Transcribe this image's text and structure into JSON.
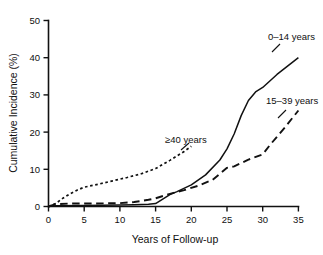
{
  "chart_data": {
    "type": "line",
    "title": "",
    "xlabel": "Years of Follow-up",
    "ylabel": "Cumulative Incidence (%)",
    "xlim": [
      0,
      35
    ],
    "ylim": [
      0,
      50
    ],
    "xticks": [
      "0",
      "5",
      "10",
      "15",
      "20",
      "25",
      "30",
      "35"
    ],
    "yticks": [
      "0",
      "10",
      "20",
      "30",
      "40",
      "50"
    ],
    "grid": false,
    "legend_position": "inline-annotations",
    "series": [
      {
        "name": "0–14 years",
        "style": "solid",
        "color": "#111111",
        "x": [
          0,
          1,
          5,
          10,
          12,
          14,
          15,
          16,
          17,
          18,
          20,
          22,
          24,
          25,
          26,
          27,
          28,
          29,
          30,
          32,
          35
        ],
        "values": [
          0,
          0.2,
          0.3,
          0.4,
          0.5,
          0.6,
          0.8,
          2.0,
          3.2,
          4.0,
          5.8,
          8.5,
          12.5,
          15.5,
          19.5,
          24.5,
          28.5,
          30.8,
          32.0,
          35.5,
          40.0
        ]
      },
      {
        "name": "15–39 years",
        "style": "dashed",
        "color": "#111111",
        "x": [
          0,
          1,
          3,
          6,
          10,
          12,
          14,
          15,
          17,
          19,
          21,
          23,
          25,
          26,
          28,
          30,
          31,
          33,
          35
        ],
        "values": [
          0,
          0.6,
          0.8,
          0.8,
          0.9,
          1.2,
          1.8,
          2.2,
          3.4,
          4.4,
          5.6,
          7.2,
          10.4,
          10.8,
          12.6,
          14.0,
          16.5,
          21.0,
          25.8
        ]
      },
      {
        "name": "≥40 years",
        "style": "dotted",
        "color": "#111111",
        "x": [
          0,
          1,
          2,
          3,
          4,
          5,
          7,
          9,
          11,
          13,
          15,
          17,
          18,
          19,
          20
        ],
        "values": [
          0,
          0.8,
          2.2,
          3.4,
          4.4,
          5.2,
          6.0,
          6.9,
          7.8,
          8.8,
          10.2,
          12.4,
          13.6,
          14.8,
          16.2
        ]
      }
    ],
    "annotations": [
      {
        "text": "0–14 years",
        "series": "0–14 years"
      },
      {
        "text": "15–39 years",
        "series": "15–39 years"
      },
      {
        "text": "≥40 years",
        "series": "≥40 years"
      }
    ]
  }
}
